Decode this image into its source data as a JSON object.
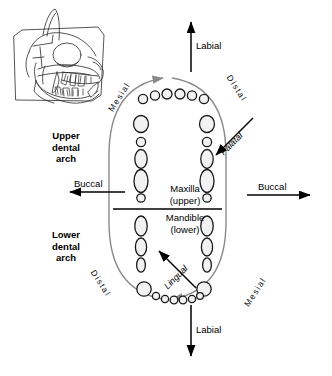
{
  "diagram": {
    "skull": {
      "name": "feline-skull-lateral-view",
      "description": "Line drawing of a cat skull in lateral view with mandible"
    },
    "arch_labels": {
      "upper": "Upper\ndental\narch",
      "upper_lines": [
        "Upper",
        "dental",
        "arch"
      ],
      "lower": "Lower\ndental\narch",
      "lower_lines": [
        "Lower",
        "dental",
        "arch"
      ]
    },
    "jaw_labels": {
      "maxilla_line1": "Maxilla",
      "maxilla_line2": "(upper)",
      "mandible_line1": "Mandible",
      "mandible_line2": "(lower)"
    },
    "directions": {
      "labial_top": "Labial",
      "labial_bottom": "Labial",
      "buccal_left": "Buccal",
      "buccal_right": "Buccal",
      "palatal": "Palatal",
      "lingual": "Lingual",
      "mesial_top_left": "Mesial",
      "distal_top_right": "Distal",
      "distal_bottom_left": "Distal",
      "mesial_bottom_right": "Mesial"
    },
    "colors": {
      "ink": "#000000",
      "arc": "#8a8a8a",
      "tooth_fill": "#f2f2f2",
      "tooth_stroke": "#1a1a1a",
      "background": "#ffffff"
    },
    "teeth": {
      "upper_incisors_count": 6,
      "lower_incisors_count": 6,
      "upper_left_column_count": 5,
      "upper_right_column_count": 5,
      "lower_left_column_count": 4,
      "lower_right_column_count": 4
    }
  }
}
